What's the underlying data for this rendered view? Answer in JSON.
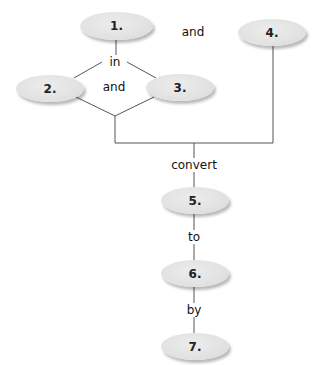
{
  "diagram": {
    "nodes": [
      {
        "id": "1",
        "label": "1."
      },
      {
        "id": "2",
        "label": "2."
      },
      {
        "id": "3",
        "label": "3."
      },
      {
        "id": "4",
        "label": "4."
      },
      {
        "id": "5",
        "label": "5."
      },
      {
        "id": "6",
        "label": "6."
      },
      {
        "id": "7",
        "label": "7."
      }
    ],
    "connectors": {
      "and_top": "and",
      "in": "in",
      "and_middle": "and",
      "convert": "convert",
      "to": "to",
      "by": "by"
    },
    "colors": {
      "node_fill": "#e4e4e4",
      "line": "#555555",
      "text": "#222222"
    }
  }
}
